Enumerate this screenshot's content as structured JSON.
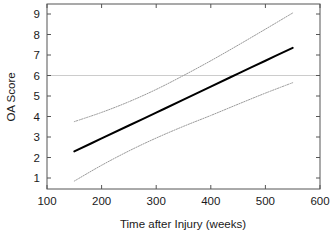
{
  "chart_data": {
    "type": "line",
    "title": "",
    "subtitle": "",
    "xlabel": "Time after Injury (weeks)",
    "ylabel": "OA Score",
    "xlim": [
      100,
      600
    ],
    "ylim": [
      0.5,
      9.4
    ],
    "xticks": [
      100,
      200,
      300,
      400,
      500,
      600
    ],
    "yticks": [
      1,
      2,
      3,
      4,
      5,
      6,
      7,
      8,
      9
    ],
    "xtick_labels": [
      "100",
      "200",
      "300",
      "400",
      "500",
      "600"
    ],
    "ytick_labels": [
      "1",
      "2",
      "3",
      "4",
      "5",
      "6",
      "7",
      "8",
      "9"
    ],
    "grid": false,
    "legend": null,
    "legend_position": "none",
    "annotations": [
      {
        "name": "reference-line-oa-6",
        "type": "hline",
        "y": 6,
        "color": "#cccccc",
        "style": "solid"
      }
    ],
    "series": [
      {
        "name": "Fitted regression line",
        "role": "fit",
        "style": "solid",
        "width": 2,
        "color": "#000000",
        "x": [
          150,
          200,
          250,
          300,
          350,
          400,
          450,
          500,
          550
        ],
        "values": [
          2.3,
          2.93,
          3.56,
          4.19,
          4.82,
          5.46,
          6.09,
          6.72,
          7.35
        ]
      },
      {
        "name": "Upper 95% confidence band",
        "role": "upper-ci",
        "style": "dotted",
        "width": 1,
        "color": "#9a9a9a",
        "x": [
          150,
          200,
          250,
          300,
          350,
          400,
          450,
          500,
          550
        ],
        "values": [
          3.75,
          4.2,
          4.72,
          5.32,
          6.0,
          6.72,
          7.48,
          8.26,
          9.05
        ]
      },
      {
        "name": "Lower 95% confidence band",
        "role": "lower-ci",
        "style": "dotted",
        "width": 1,
        "color": "#9a9a9a",
        "x": [
          150,
          200,
          250,
          300,
          350,
          400,
          450,
          500,
          550
        ],
        "values": [
          0.85,
          1.62,
          2.32,
          2.95,
          3.52,
          4.05,
          4.6,
          5.14,
          5.65
        ]
      }
    ],
    "colors": {
      "fit_line": "#000000",
      "confidence_band": "#9a9a9a",
      "reference_line": "#cccccc",
      "axis": "#555555",
      "background": "#ffffff",
      "text": "#1a1a1a"
    }
  }
}
